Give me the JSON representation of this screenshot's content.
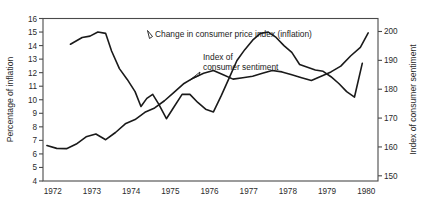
{
  "figure": {
    "background": "#ffffff",
    "line_color": "#1a1a1a",
    "axis_color": "#4a4a4a"
  },
  "annotations": {
    "cpi_label": "Change in consumer price index (inflation)",
    "sentiment_label_line1": "Index of",
    "sentiment_label_line2": "consumer sentiment"
  },
  "chart_data": {
    "type": "line",
    "title": "",
    "xlabel": "",
    "ylabel": "Percentage of inflation",
    "y2label": "Index of consumer sentiment",
    "grid": false,
    "legend_position": "inline-annotations",
    "xlim": [
      1971.75,
      1980.3
    ],
    "ylim": [
      4,
      16
    ],
    "y2lim": [
      148.2,
      204.5
    ],
    "yticks": [
      4,
      5,
      6,
      7,
      8,
      9,
      10,
      11,
      12,
      13,
      14,
      15,
      16
    ],
    "y2ticks": [
      150,
      160,
      170,
      180,
      190,
      200
    ],
    "xticks": [
      1972,
      1973,
      1974,
      1975,
      1976,
      1977,
      1978,
      1979,
      1980
    ],
    "xticklabels": [
      "1972",
      "1973",
      "1974",
      "1975",
      "1976",
      "1977",
      "1978",
      "1979",
      "1980"
    ],
    "series": [
      {
        "name": "Change in consumer price index (inflation)",
        "axis": "left",
        "units": "percent",
        "x": [
          1972.45,
          1972.75,
          1972.95,
          1973.15,
          1973.35,
          1973.5,
          1973.7,
          1973.9,
          1974.1,
          1974.25,
          1974.4,
          1974.55,
          1974.7,
          1974.9,
          1975.1,
          1975.3,
          1975.5,
          1975.7,
          1975.9,
          1976.1,
          1976.3,
          1976.5,
          1976.7,
          1976.9,
          1977.1,
          1977.3,
          1977.5,
          1977.7,
          1977.9,
          1978.1,
          1978.3,
          1978.5,
          1978.7,
          1978.9,
          1979.1,
          1979.3,
          1979.5,
          1979.7,
          1979.9
        ],
        "values": [
          14.1,
          14.6,
          14.7,
          15.0,
          14.9,
          13.6,
          12.3,
          11.5,
          10.6,
          9.5,
          10.1,
          10.4,
          9.7,
          8.6,
          9.5,
          10.4,
          10.4,
          9.8,
          9.3,
          9.1,
          10.3,
          11.6,
          12.9,
          13.7,
          14.4,
          14.9,
          15.0,
          14.6,
          14.0,
          13.5,
          12.6,
          12.4,
          12.2,
          12.1,
          11.7,
          11.2,
          10.6,
          10.2,
          12.7
        ]
      },
      {
        "name": "Index of consumer sentiment",
        "axis": "right",
        "units": "index",
        "x": [
          1971.85,
          1972.1,
          1972.35,
          1972.6,
          1972.85,
          1973.1,
          1973.35,
          1973.6,
          1973.85,
          1974.1,
          1974.35,
          1974.6,
          1974.85,
          1975.1,
          1975.35,
          1975.6,
          1975.85,
          1976.1,
          1976.35,
          1976.6,
          1976.85,
          1977.1,
          1977.35,
          1977.6,
          1977.85,
          1978.1,
          1978.35,
          1978.6,
          1978.85,
          1979.1,
          1979.35,
          1979.6,
          1979.85,
          1980.05
        ],
        "values": [
          160.5,
          159.5,
          159.4,
          161.0,
          163.5,
          164.5,
          162.5,
          165.0,
          168.0,
          169.5,
          172.0,
          173.5,
          176.0,
          179.0,
          182.0,
          184.0,
          185.5,
          186.5,
          185.0,
          183.5,
          184.0,
          184.5,
          185.5,
          186.5,
          186.0,
          185.0,
          184.0,
          183.0,
          184.5,
          186.0,
          188.0,
          191.5,
          194.5,
          199.5
        ]
      }
    ]
  }
}
